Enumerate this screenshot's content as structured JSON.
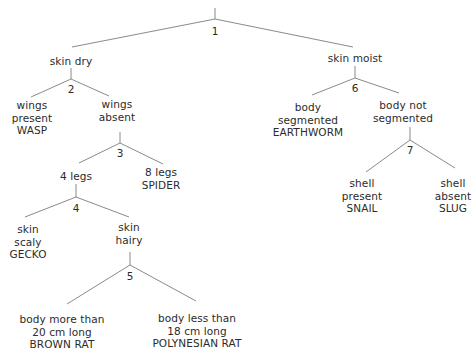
{
  "diagram": {
    "type": "dichotomous-key",
    "nodes": [
      {
        "id": "1"
      },
      {
        "id": "2"
      },
      {
        "id": "3"
      },
      {
        "id": "4"
      },
      {
        "id": "5"
      },
      {
        "id": "6"
      },
      {
        "id": "7"
      }
    ],
    "labels": {
      "skin_dry": [
        "skin dry"
      ],
      "skin_moist": [
        "skin moist"
      ],
      "wings_present": [
        "wings",
        "present",
        "WASP"
      ],
      "wings_absent": [
        "wings",
        "absent"
      ],
      "four_legs": [
        "4 legs"
      ],
      "eight_legs": [
        "8 legs",
        "SPIDER"
      ],
      "skin_scaly": [
        "skin",
        "scaly",
        "GECKO"
      ],
      "skin_hairy": [
        "skin",
        "hairy"
      ],
      "body_more": [
        "body more than",
        "20 cm long",
        "BROWN RAT"
      ],
      "body_less": [
        "body less than",
        "18 cm long",
        "POLYNESIAN RAT"
      ],
      "body_segmented": [
        "body",
        "segmented",
        "EARTHWORM"
      ],
      "body_not_segmented": [
        "body not",
        "segmented"
      ],
      "shell_present": [
        "shell",
        "present",
        "SNAIL"
      ],
      "shell_absent": [
        "shell",
        "absent",
        "SLUG"
      ]
    },
    "edges": [
      {
        "from": "1",
        "to": "skin dry"
      },
      {
        "from": "1",
        "to": "skin moist"
      },
      {
        "from": "2",
        "to": "wings present WASP"
      },
      {
        "from": "2",
        "to": "wings absent"
      },
      {
        "from": "3",
        "to": "4 legs"
      },
      {
        "from": "3",
        "to": "8 legs SPIDER"
      },
      {
        "from": "4",
        "to": "skin scaly GECKO"
      },
      {
        "from": "4",
        "to": "skin hairy"
      },
      {
        "from": "5",
        "to": "body more than 20 cm long BROWN RAT"
      },
      {
        "from": "5",
        "to": "body less than 18 cm long POLYNESIAN RAT"
      },
      {
        "from": "6",
        "to": "body segmented EARTHWORM"
      },
      {
        "from": "6",
        "to": "body not segmented"
      },
      {
        "from": "7",
        "to": "shell present SNAIL"
      },
      {
        "from": "7",
        "to": "shell absent SLUG"
      }
    ],
    "colors": {
      "line": "#8a8a8a",
      "text": "#2b2b2b",
      "background": "#ffffff"
    }
  }
}
